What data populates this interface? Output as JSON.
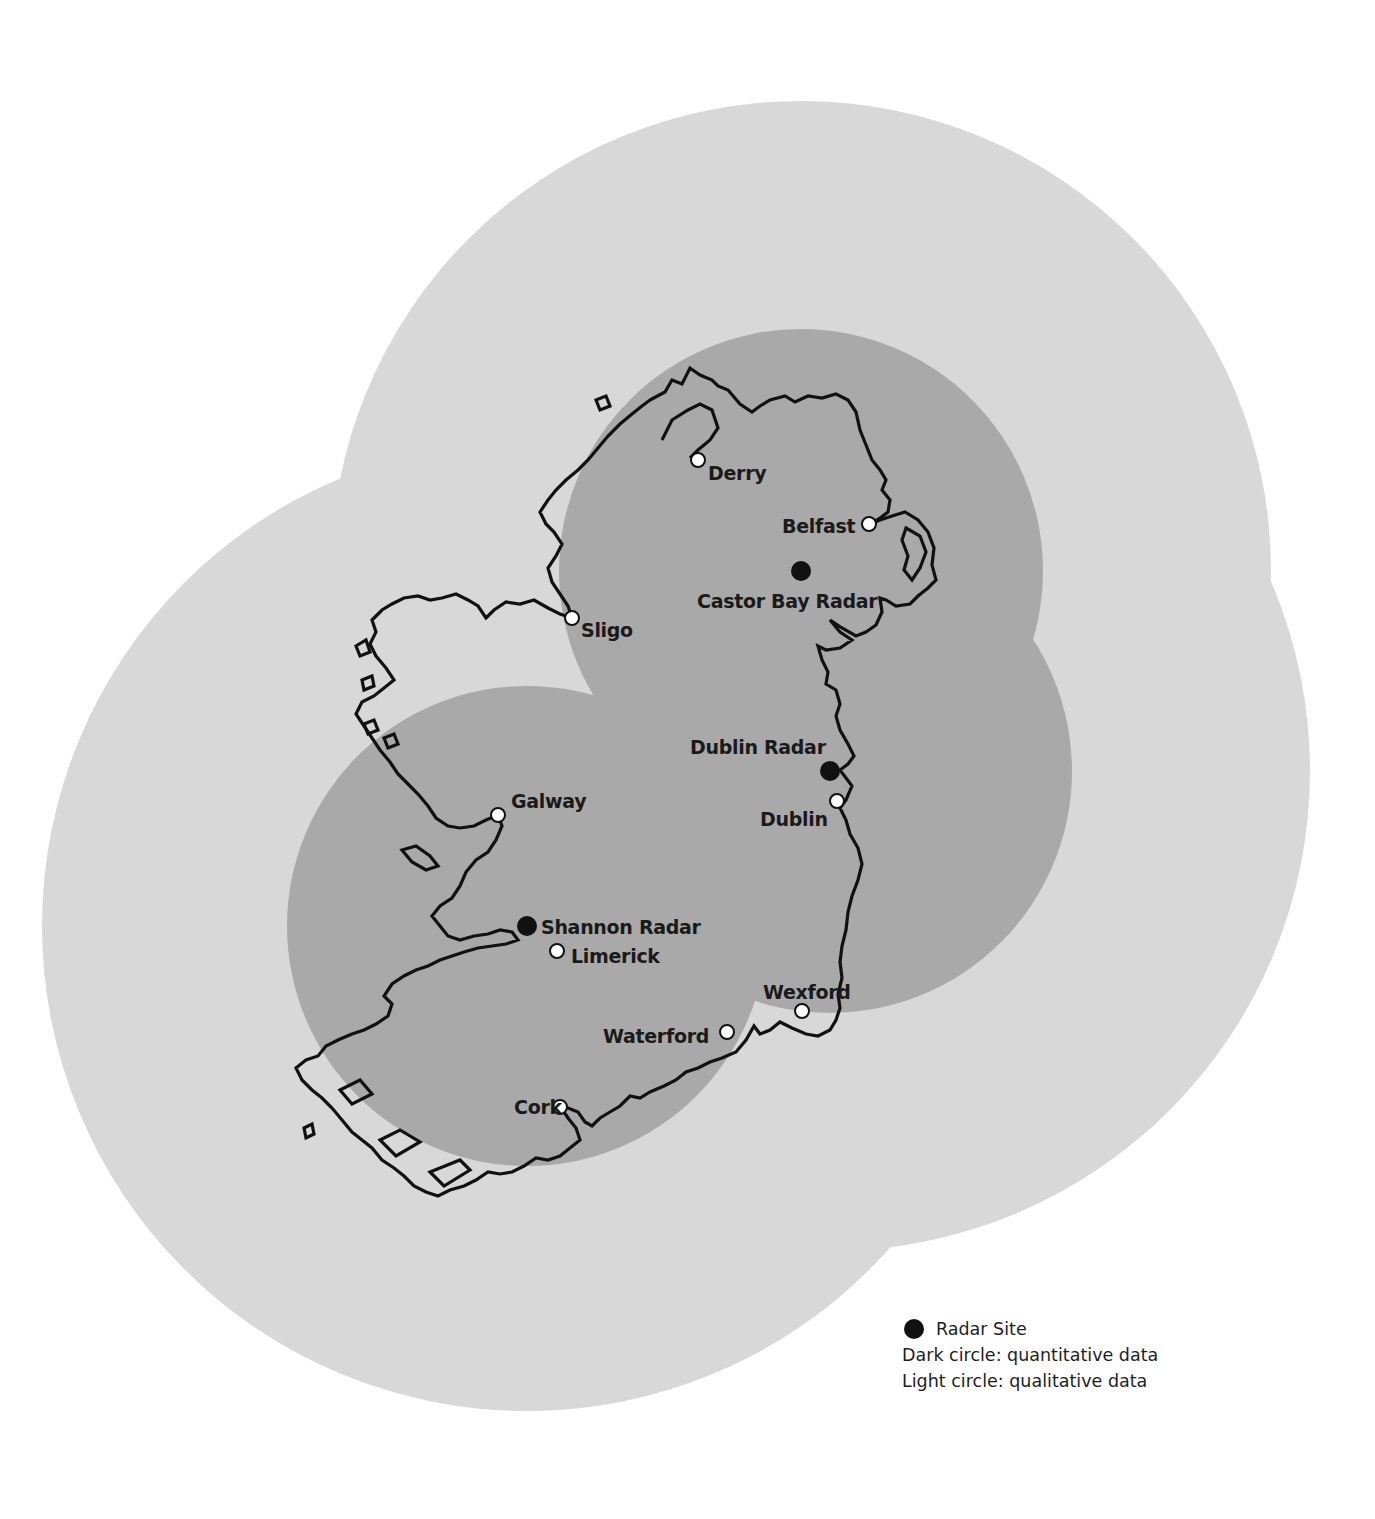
{
  "map": {
    "colors": {
      "background": "#ffffff",
      "light_circle": "#d8d8d8",
      "dark_circle": "#a9a9a9",
      "coastline": "#111111",
      "radar_site": "#111111",
      "city_marker": "#ffffff"
    },
    "radars": [
      {
        "name": "Castor Bay Radar",
        "label": "Castor Bay Radar",
        "x": 801,
        "y": 571,
        "quantitative_radius": 242,
        "qualitative_radius": 470
      },
      {
        "name": "Dublin Radar",
        "label": "Dublin Radar",
        "x": 830,
        "y": 771,
        "quantitative_radius": 242,
        "qualitative_radius": 480
      },
      {
        "name": "Shannon Radar",
        "label": "Shannon Radar",
        "x": 527,
        "y": 926,
        "quantitative_radius": 240,
        "qualitative_radius": 485
      }
    ],
    "cities": [
      {
        "name": "Derry",
        "x": 698,
        "y": 460
      },
      {
        "name": "Belfast",
        "x": 869,
        "y": 524
      },
      {
        "name": "Sligo",
        "x": 572,
        "y": 618
      },
      {
        "name": "Galway",
        "x": 498,
        "y": 815
      },
      {
        "name": "Dublin",
        "x": 837,
        "y": 801
      },
      {
        "name": "Limerick",
        "x": 557,
        "y": 951
      },
      {
        "name": "Wexford",
        "x": 802,
        "y": 1011
      },
      {
        "name": "Waterford",
        "x": 727,
        "y": 1032
      },
      {
        "name": "Cork",
        "x": 560,
        "y": 1107
      }
    ]
  },
  "legend": {
    "radar_site": "Radar Site",
    "dark_circle": "Dark circle: quantitative data",
    "light_circle": "Light circle: qualitative data"
  }
}
